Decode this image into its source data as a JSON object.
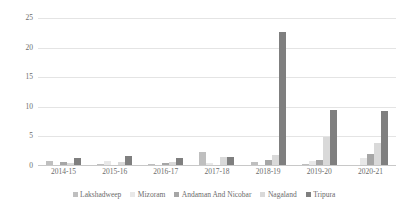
{
  "chart_data": {
    "type": "bar",
    "title": "",
    "subtitle": "",
    "xlabel": "",
    "ylabel": "",
    "ylim": [
      0,
      25
    ],
    "yticks": [
      0,
      5,
      10,
      15,
      20,
      25
    ],
    "grid": true,
    "legend_position": "bottom",
    "categories": [
      "2014-15",
      "2015-16",
      "2016-17",
      "2017-18",
      "2018-19",
      "2019-20",
      "2020-21"
    ],
    "series": [
      {
        "name": "Lakshadweep",
        "color": "#bfbfbf",
        "values": [
          0.9,
          0.3,
          0.3,
          2.3,
          0.6,
          0.3,
          0.2
        ]
      },
      {
        "name": "Mizoram",
        "color": "#e8e8e8",
        "values": [
          0.15,
          0.9,
          0.2,
          0.5,
          0.2,
          0.9,
          1.4
        ]
      },
      {
        "name": "Andaman And Nicobar",
        "color": "#a6a6a6",
        "values": [
          0.6,
          0.2,
          0.5,
          0.25,
          1.1,
          1.0,
          2.1
        ]
      },
      {
        "name": "Nagaland",
        "color": "#d9d9d9",
        "values": [
          0.5,
          0.6,
          0.7,
          1.6,
          1.9,
          4.9,
          3.9
        ]
      },
      {
        "name": "Tripura",
        "color": "#7f7f7f",
        "values": [
          1.4,
          1.7,
          1.3,
          1.6,
          22.7,
          9.4,
          9.3
        ]
      }
    ]
  },
  "legend": {
    "items": [
      {
        "label": "Lakshadweep"
      },
      {
        "label": "Mizoram"
      },
      {
        "label": "Andaman And Nicobar"
      },
      {
        "label": "Nagaland"
      },
      {
        "label": "Tripura"
      }
    ]
  }
}
